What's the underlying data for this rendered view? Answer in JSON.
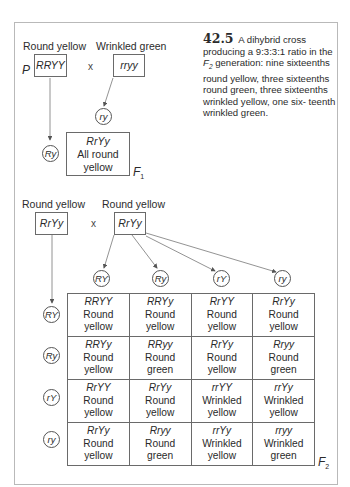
{
  "figure": {
    "number": "42.5",
    "caption": "A dihybrid cross producing a 9:3:3:1 ratio in the F₂ generation: nine sixteenths round yellow, three sixteenths round green, three sixteenths wrinkled yellow, one sixteenth wrinkled green.",
    "caption_parts": {
      "pre": "A dihybrid cross producing a 9:3:3:1 ratio in the ",
      "gen": "F",
      "gen_sub": "2",
      "post": " generation: nine sixteenths round yellow, three sixteenths round green, three sixteenths wrinkled yellow, one six- teenth wrinkled green."
    }
  },
  "parental": {
    "label": "P",
    "cross_symbol": "x",
    "parent1": {
      "phenotype": "Round yellow",
      "genotype": "RRYY",
      "gamete": "Ry"
    },
    "parent2": {
      "phenotype": "Wrinkled green",
      "genotype": "rryy",
      "gamete": "ry"
    }
  },
  "f1": {
    "label": "F",
    "label_sub": "1",
    "genotype": "RrYy",
    "phenotype_line1": "All round",
    "phenotype_line2": "yellow"
  },
  "f1_cross": {
    "cross_symbol": "x",
    "parent1": {
      "phenotype": "Round yellow",
      "genotype": "RrYy"
    },
    "parent2": {
      "phenotype": "Round yellow",
      "genotype": "RrYy"
    }
  },
  "punnett": {
    "label": "F",
    "label_sub": "2",
    "column_gametes": [
      "RY",
      "Ry",
      "rY",
      "ry"
    ],
    "row_gametes": [
      "RY",
      "Ry",
      "rY",
      "ry"
    ],
    "rows": [
      [
        {
          "genotype": "RRYY",
          "shape": "Round",
          "color": "yellow"
        },
        {
          "genotype": "RRYy",
          "shape": "Round",
          "color": "yellow"
        },
        {
          "genotype": "RrYY",
          "shape": "Round",
          "color": "yellow"
        },
        {
          "genotype": "RrYy",
          "shape": "Round",
          "color": "yellow"
        }
      ],
      [
        {
          "genotype": "RRYy",
          "shape": "Round",
          "color": "yellow"
        },
        {
          "genotype": "RRyy",
          "shape": "Round",
          "color": "green"
        },
        {
          "genotype": "RrYy",
          "shape": "Round",
          "color": "yellow"
        },
        {
          "genotype": "Rryy",
          "shape": "Round",
          "color": "green"
        }
      ],
      [
        {
          "genotype": "RrYY",
          "shape": "Round",
          "color": "yellow"
        },
        {
          "genotype": "RrYy",
          "shape": "Round",
          "color": "yellow"
        },
        {
          "genotype": "rrYY",
          "shape": "Wrinkled",
          "color": "yellow"
        },
        {
          "genotype": "rrYy",
          "shape": "Wrinkled",
          "color": "yellow"
        }
      ],
      [
        {
          "genotype": "RrYy",
          "shape": "Round",
          "color": "yellow"
        },
        {
          "genotype": "Rryy",
          "shape": "Round",
          "color": "green"
        },
        {
          "genotype": "rrYy",
          "shape": "Wrinkled",
          "color": "yellow"
        },
        {
          "genotype": "rryy",
          "shape": "Wrinkled",
          "color": "green"
        }
      ]
    ]
  },
  "colors": {
    "line": "#6a6a6a",
    "frame": "#b9b9b9",
    "text": "#2b2b2b"
  }
}
